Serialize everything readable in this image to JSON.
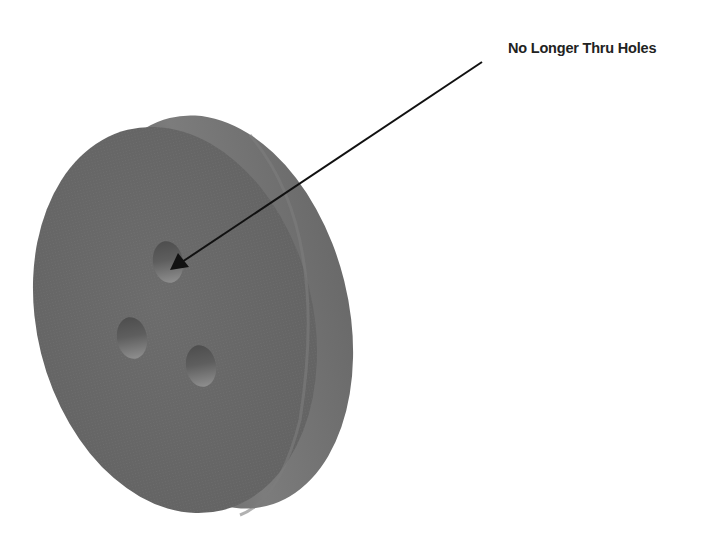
{
  "callout": {
    "label": "No Longer Thru Holes",
    "target": "top-hole"
  },
  "part": {
    "type": "disk",
    "hole_count": 3,
    "holes": [
      "top-hole",
      "left-hole",
      "right-hole"
    ],
    "colors": {
      "face": "#6a6a6a",
      "rim": "#7a7a7a",
      "rim_shadow": "#5a5a5a",
      "hole_dark": "#555555",
      "hole_light": "#8a8a8a"
    }
  },
  "arrow": {
    "color": "#111111"
  }
}
